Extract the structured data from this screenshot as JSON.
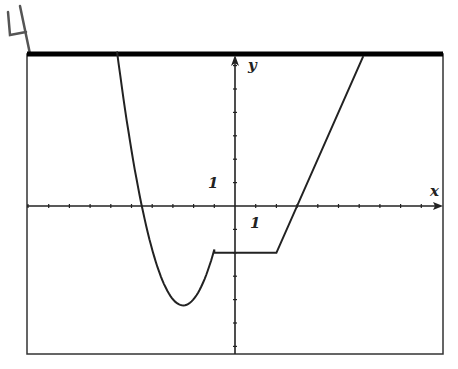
{
  "annotation": {
    "text": "4"
  },
  "chart_data": {
    "type": "line",
    "title": "",
    "xlabel": "x",
    "ylabel": "y",
    "x_tick_label": "1",
    "y_tick_label": "1",
    "xlim": [
      -10,
      10
    ],
    "ylim": [
      -6.4,
      6.4
    ],
    "grid": false,
    "series": [
      {
        "name": "f(x)",
        "pieces": [
          {
            "kind": "parabola",
            "vertex": [
              -2.5,
              -4.25
            ],
            "a": 1.06,
            "x_range": [
              -5.7,
              -1
            ]
          },
          {
            "kind": "segment",
            "points": [
              [
                -1,
                -2
              ],
              [
                2,
                -2
              ]
            ]
          },
          {
            "kind": "segment",
            "points": [
              [
                2,
                -2
              ],
              [
                6.2,
                6.4
              ]
            ]
          }
        ],
        "key_points": [
          [
            -4.5,
            0
          ],
          [
            -2.5,
            -4.25
          ],
          [
            -1,
            -2
          ],
          [
            2,
            -2
          ],
          [
            3,
            0
          ]
        ]
      }
    ]
  },
  "axes": {
    "x_label": "x",
    "y_label": "y",
    "x_unit_label": "1",
    "y_unit_label": "1"
  }
}
